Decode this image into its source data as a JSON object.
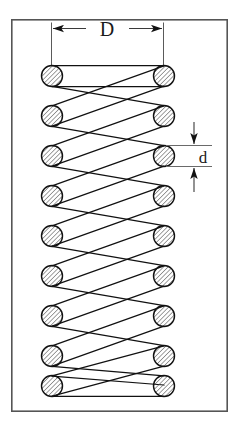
{
  "figure": {
    "background_color": "#ffffff",
    "line_color": "#1a1a1a",
    "hatch_color": "#4d4d4d",
    "frame": {
      "name": "drawing-border",
      "x": 11,
      "y": 19,
      "width": 217,
      "height": 393,
      "stroke": "#555555",
      "stroke_width": 1.6,
      "fill": "#ffffff"
    },
    "annotations": [
      {
        "id": "mean-diameter",
        "label": "D",
        "meaning": "mean coil diameter",
        "orientation": "horizontal",
        "arrow_direction": "outward",
        "label_x": 107,
        "label_y": 36,
        "dim_line_y": 28,
        "left_x": 51,
        "right_x": 163,
        "ext_top_y": 22,
        "ext_bottom_y": 66
      },
      {
        "id": "wire-diameter",
        "label": "d",
        "meaning": "wire diameter",
        "orientation": "vertical",
        "arrow_direction": "inward",
        "label_x": 203,
        "label_y": 170,
        "dim_line_x": 194,
        "top_y": 122,
        "bottom_y": 192,
        "ext_left_x": 164,
        "ext_right_x": 212,
        "ext_upper_y": 145,
        "ext_lower_y": 163
      }
    ],
    "spring": {
      "coil_count": 9,
      "wire_radius": 10.5,
      "left_center_x": 52,
      "right_center_x": 164,
      "first_center_y": 76,
      "row_spacing": 40,
      "hatch_angle_degrees": 45,
      "hatch_spacing": 2.6,
      "left_coil_centers_y": [
        76,
        116,
        156,
        196,
        236,
        276,
        316,
        356,
        386
      ],
      "right_coil_centers_y": [
        76,
        116,
        156,
        196,
        236,
        276,
        316,
        356,
        386
      ],
      "closed_end_top": true,
      "closed_end_bottom": true
    }
  }
}
